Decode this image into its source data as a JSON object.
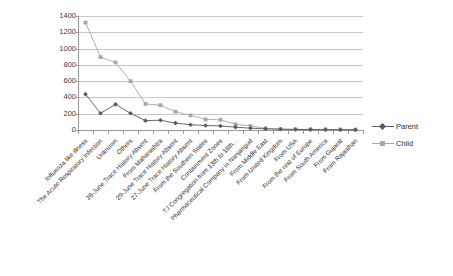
{
  "chart_data": {
    "type": "line",
    "title": "",
    "xlabel": "",
    "ylabel": "",
    "ylim": [
      0,
      1400
    ],
    "ytick_step": 200,
    "yticks": [
      1400,
      1200,
      1000,
      800,
      600,
      400,
      200,
      0
    ],
    "grid": true,
    "legend_position": "right",
    "categories": [
      "Influenza like illness",
      "The Acute Respiratory Infection",
      "Unknown",
      "Others",
      "28-June Trace History Absent",
      "From Maharashtra",
      "29-June Trace History Absent",
      "27-June Trace History Absent",
      "From the Southern States",
      "Containment Zones",
      "TJ Congregation from 13th to 18th...",
      "Pharmaceutical Company in Nanjangud",
      "From Middle East",
      "From United Kingdom",
      "From USA",
      "From the rest of Europe",
      "From South America",
      "From Gujarat",
      "From Rajasthan"
    ],
    "series": [
      {
        "name": "Parent",
        "color": "#595959",
        "marker": "diamond",
        "values": [
          440,
          205,
          315,
          205,
          115,
          120,
          85,
          65,
          55,
          50,
          35,
          22,
          14,
          9,
          6,
          5,
          4,
          3,
          2
        ]
      },
      {
        "name": "Child",
        "color": "#a6a6a6",
        "marker": "square",
        "values": [
          1320,
          895,
          830,
          600,
          320,
          305,
          225,
          180,
          130,
          125,
          70,
          50,
          20,
          12,
          9,
          8,
          7,
          6,
          5
        ]
      }
    ]
  },
  "legend": {
    "items": [
      {
        "label": "Parent",
        "color": "#595959",
        "marker": "diamond"
      },
      {
        "label": "Child",
        "color": "#a6a6a6",
        "marker": "square"
      }
    ]
  },
  "colors": {
    "parent": "#595959",
    "child": "#a6a6a6",
    "grid": "#c8c8c8",
    "axis": "#9a9a9a",
    "text": "#2e2e2e",
    "background": "#ffffff"
  }
}
